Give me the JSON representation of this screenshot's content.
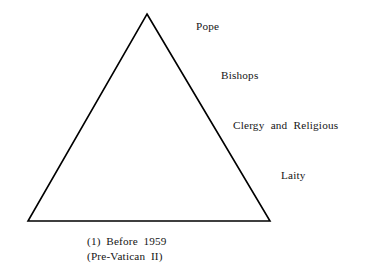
{
  "figure": {
    "background_color": "#ffffff",
    "stroke_color": "#000000",
    "text_color": "#151515",
    "shape": {
      "name": "triangle",
      "apex": {
        "x": 147,
        "y": 14
      },
      "bottom_left": {
        "x": 28,
        "y": 221
      },
      "bottom_right": {
        "x": 270,
        "y": 221
      },
      "stroke_width": 1.6
    },
    "tiers": [
      {
        "label": "Pope",
        "x": 196,
        "y": 21
      },
      {
        "label": "Bishops",
        "x": 221,
        "y": 70
      },
      {
        "label": "Clergy and Religious",
        "x": 233,
        "y": 120
      },
      {
        "label": "Laity",
        "x": 281,
        "y": 170
      }
    ],
    "caption": {
      "line1": "(1)  Before  1959",
      "line2": "(Pre-Vatican  II)"
    }
  }
}
